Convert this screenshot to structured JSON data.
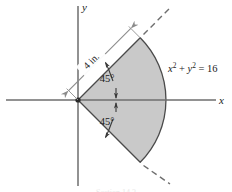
{
  "figure": {
    "kind": "geometry-diagram",
    "background_color": "#ffffff",
    "sector_fill_color": "#c9c9c9",
    "sector_stroke_color": "#4a4a4a",
    "axis_color": "#6e6e6e",
    "dimension_color": "#8a8a8a",
    "text_color": "#1a1a1a"
  },
  "axes": {
    "x_label": "x",
    "y_label": "y",
    "origin_marker": "origin-dot"
  },
  "sector": {
    "radius_px": 88,
    "start_angle_deg": -45,
    "end_angle_deg": 45,
    "center_px": {
      "x": 78,
      "y": 100
    }
  },
  "labels": {
    "radius_dimension": "4 in.",
    "angle_upper": "45°",
    "angle_lower": "45°",
    "equation_parts": {
      "x_var": "x",
      "x_exp": "2",
      "plus": " + ",
      "y_var": "y",
      "y_exp": "2",
      "equals": " = ",
      "value": "16"
    },
    "equation_full": "x² + y² = 16"
  },
  "caption": {
    "cut_off_text": "Section 14.3"
  }
}
